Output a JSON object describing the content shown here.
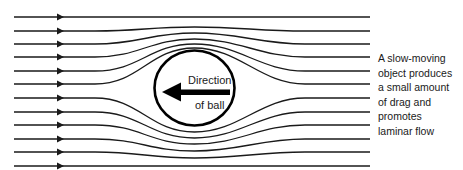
{
  "diagram": {
    "ball_label": {
      "line1": "Direction",
      "line2": "of ball"
    },
    "ball_arrow_direction": "left",
    "streamline_count": 12,
    "streamlines_left_y": [
      17,
      31,
      44,
      57,
      71,
      84,
      98,
      112,
      125,
      139,
      152,
      166
    ],
    "streamlines_center_y": [
      17,
      27,
      33,
      39,
      44,
      48,
      132,
      138,
      144,
      151,
      158,
      166
    ],
    "colors": {
      "line": "#1a1a1a",
      "ball_outline": "#000000",
      "background": "#ffffff"
    }
  },
  "caption": {
    "lines": [
      "A slow-moving",
      "object produces",
      "a small amount",
      "of drag and",
      "promotes",
      "laminar flow"
    ]
  }
}
